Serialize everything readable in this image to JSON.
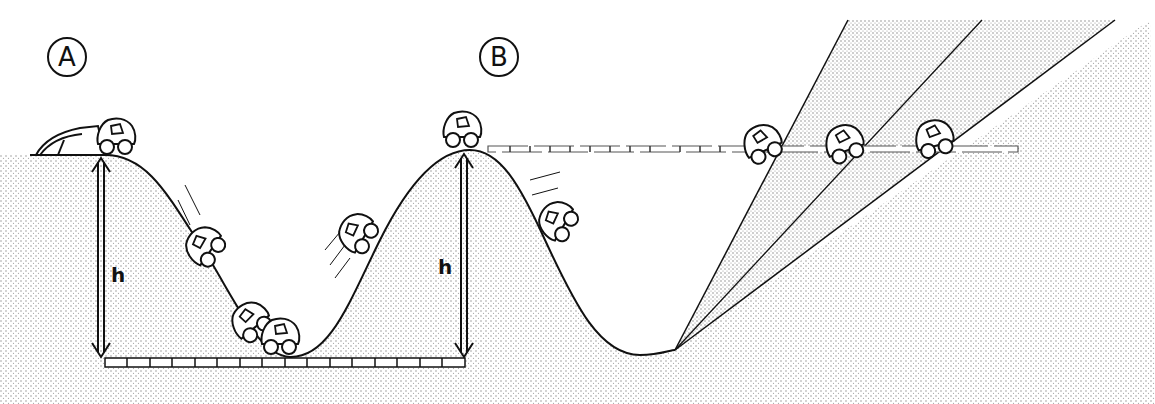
{
  "diagram": {
    "labels": {
      "a": "A",
      "b": "B",
      "height_left": "h",
      "height_right": "h"
    },
    "colors": {
      "ink": "#111111",
      "stipple": "#9a9a9a",
      "background": "#ffffff"
    },
    "panels": [
      {
        "id": "A",
        "description": "car on hill descends into valley and climbs back to same height h"
      },
      {
        "id": "B",
        "description": "car at top of hill height h; right-side ramps of decreasing slope reach same height"
      }
    ]
  }
}
